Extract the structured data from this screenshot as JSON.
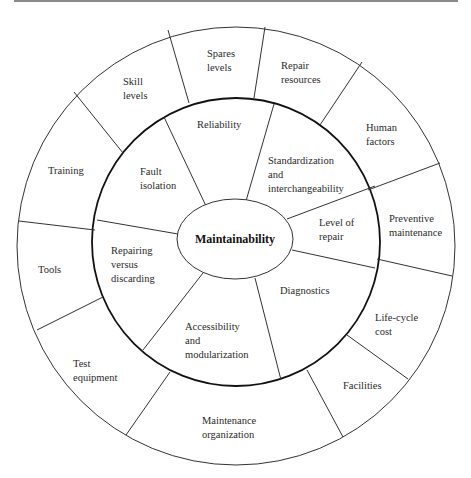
{
  "diagram": {
    "center": {
      "label": "Maintainability"
    },
    "inner_ring": [
      {
        "id": "reliability",
        "lines": [
          "Reliability"
        ]
      },
      {
        "id": "standardization",
        "lines": [
          "Standardization",
          "and",
          "interchangeability"
        ]
      },
      {
        "id": "level-of-repair",
        "lines": [
          "Level of",
          "repair"
        ]
      },
      {
        "id": "diagnostics",
        "lines": [
          "Diagnostics"
        ]
      },
      {
        "id": "accessibility",
        "lines": [
          "Accessibility",
          "and",
          "modularization"
        ]
      },
      {
        "id": "repairing-vs-discarding",
        "lines": [
          "Repairing",
          "versus",
          "discarding"
        ]
      },
      {
        "id": "fault-isolation",
        "lines": [
          "Fault",
          "isolation"
        ]
      }
    ],
    "outer_ring": [
      {
        "id": "spares-levels",
        "lines": [
          "Spares",
          "levels"
        ]
      },
      {
        "id": "repair-resources",
        "lines": [
          "Repair",
          "resources"
        ]
      },
      {
        "id": "human-factors",
        "lines": [
          "Human",
          "factors"
        ]
      },
      {
        "id": "preventive-maintenance",
        "lines": [
          "Preventive",
          "maintenance"
        ]
      },
      {
        "id": "life-cycle-cost",
        "lines": [
          "Life-cycle",
          "cost"
        ]
      },
      {
        "id": "facilities",
        "lines": [
          "Facilities"
        ]
      },
      {
        "id": "maintenance-organization",
        "lines": [
          "Maintenance",
          "organization"
        ]
      },
      {
        "id": "test-equipment",
        "lines": [
          "Test",
          "equipment"
        ]
      },
      {
        "id": "tools",
        "lines": [
          "Tools"
        ]
      },
      {
        "id": "training",
        "lines": [
          "Training"
        ]
      },
      {
        "id": "skill-levels",
        "lines": [
          "Skill",
          "levels"
        ]
      }
    ],
    "colors": {
      "stroke": "#333333",
      "inner_ring_stroke": "#111111",
      "text": "#2a2a2a",
      "background": "#ffffff"
    }
  }
}
